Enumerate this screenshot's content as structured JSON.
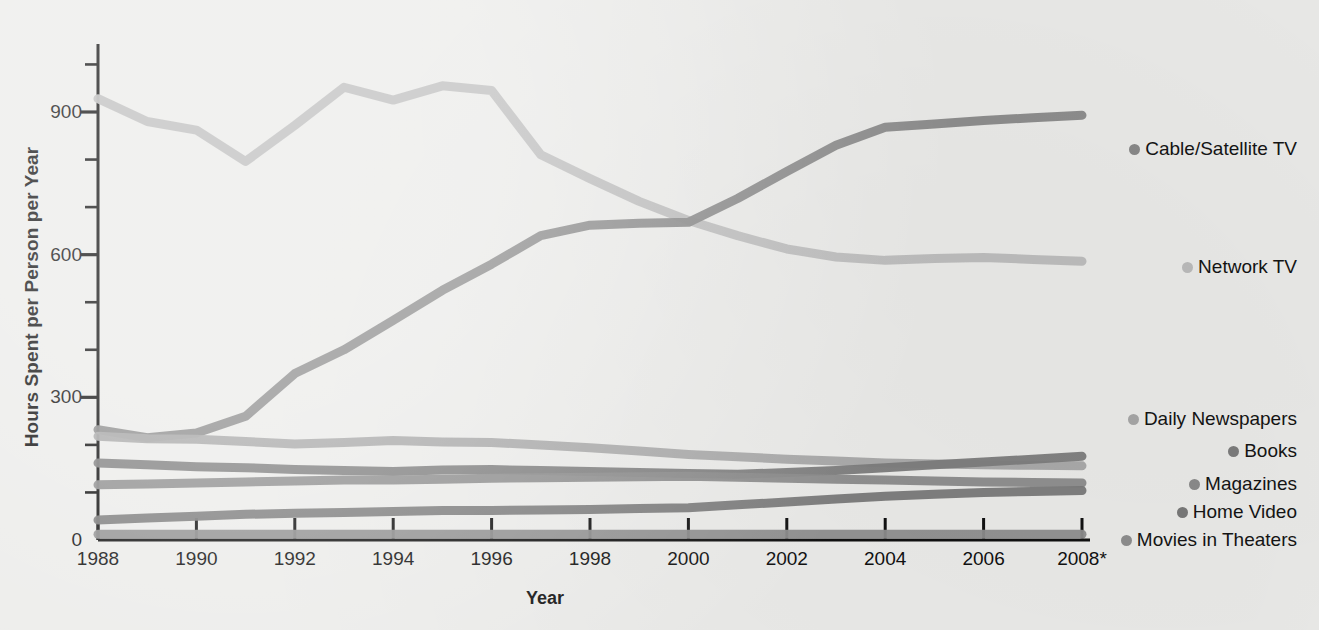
{
  "chart_data": {
    "type": "line",
    "title": "",
    "xlabel": "Year",
    "ylabel": "Hours Spent per Person per Year",
    "xlim": [
      1988,
      2008
    ],
    "ylim": [
      0,
      1000
    ],
    "y_ticks": [
      0,
      300,
      600,
      900
    ],
    "y_minor_step": 100,
    "grid": false,
    "legend_position": "right",
    "x": [
      1988,
      1989,
      1990,
      1991,
      1992,
      1993,
      1994,
      1995,
      1996,
      1997,
      1998,
      1999,
      2000,
      2001,
      2002,
      2003,
      2004,
      2005,
      2006,
      2007,
      2008
    ],
    "x_tick_labels": [
      "1988",
      "1990",
      "1992",
      "1994",
      "1996",
      "1998",
      "2000",
      "2002",
      "2004",
      "2006",
      "2008*"
    ],
    "x_tick_values": [
      1988,
      1990,
      1992,
      1994,
      1996,
      1998,
      2000,
      2002,
      2004,
      2006,
      2008
    ],
    "series": [
      {
        "name": "Cable/Satellite TV",
        "color": "#8a8a8a",
        "values": [
          232,
          215,
          225,
          260,
          350,
          400,
          462,
          525,
          580,
          640,
          662,
          666,
          668,
          718,
          775,
          830,
          868,
          875,
          882,
          888,
          893
        ]
      },
      {
        "name": "Network TV",
        "color": "#bdbdbd",
        "values": [
          928,
          880,
          862,
          796,
          872,
          952,
          925,
          955,
          945,
          810,
          760,
          712,
          672,
          640,
          612,
          595,
          588,
          592,
          594,
          590,
          586
        ]
      },
      {
        "name": "Daily Newspapers",
        "color": "#a8a8a8",
        "values": [
          218,
          213,
          212,
          207,
          202,
          205,
          209,
          206,
          205,
          200,
          194,
          187,
          180,
          175,
          170,
          166,
          162,
          160,
          158,
          157,
          156
        ]
      },
      {
        "name": "Books",
        "color": "#7d7d7d",
        "values": [
          162,
          158,
          154,
          152,
          148,
          146,
          144,
          147,
          148,
          146,
          144,
          142,
          140,
          138,
          142,
          146,
          152,
          158,
          164,
          170,
          176
        ]
      },
      {
        "name": "Magazines",
        "color": "#8c8c8c",
        "values": [
          116,
          118,
          120,
          122,
          124,
          126,
          126,
          128,
          130,
          131,
          132,
          133,
          134,
          132,
          130,
          128,
          126,
          124,
          122,
          121,
          120
        ]
      },
      {
        "name": "Home Video",
        "color": "#7a7a7a",
        "values": [
          42,
          46,
          50,
          54,
          56,
          58,
          60,
          62,
          62,
          63,
          64,
          66,
          68,
          74,
          80,
          86,
          92,
          96,
          100,
          102,
          104
        ]
      },
      {
        "name": "Movies in Theaters",
        "color": "#8f8f8f",
        "values": [
          12,
          12,
          12,
          12,
          12,
          12,
          12,
          12,
          12,
          12,
          12,
          12,
          12,
          12,
          12,
          12,
          12,
          12,
          12,
          12,
          12
        ]
      }
    ],
    "legend": [
      {
        "label": "Cable/Satellite TV",
        "color": "#8a8a8a",
        "y_value": 893
      },
      {
        "label": "Network TV",
        "color": "#bdbdbd",
        "y_value": 586
      },
      {
        "label": "Daily Newspapers",
        "color": "#a8a8a8",
        "y_value": 156
      },
      {
        "label": "Books",
        "color": "#7d7d7d",
        "y_value": 176
      },
      {
        "label": "Magazines",
        "color": "#8c8c8c",
        "y_value": 120
      },
      {
        "label": "Home Video",
        "color": "#7a7a7a",
        "y_value": 104
      },
      {
        "label": "Movies in Theaters",
        "color": "#8f8f8f",
        "y_value": 12
      }
    ]
  },
  "legend_anchor_y": [
    149,
    267,
    419,
    451,
    484,
    512,
    540
  ],
  "axis": {
    "color": "#111111",
    "line_width": 3
  }
}
